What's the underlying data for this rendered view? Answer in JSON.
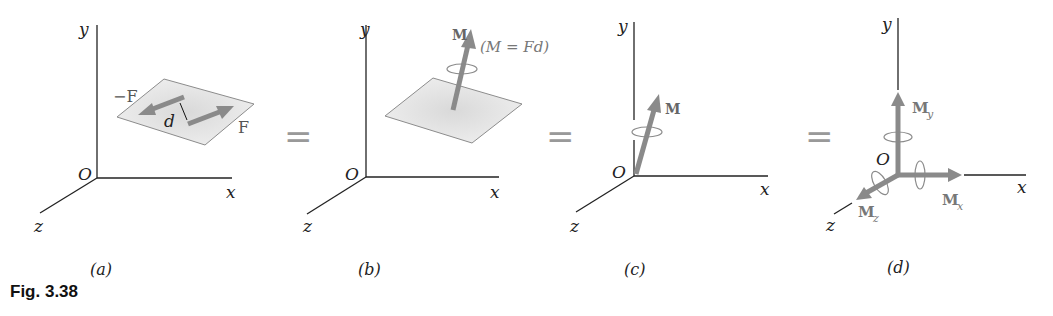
{
  "figure": {
    "caption": "Fig. 3.38",
    "equals": "=",
    "panels": [
      {
        "id": "a",
        "label": "(a)",
        "axes": {
          "x": "x",
          "y": "y",
          "z": "z",
          "origin": "O"
        },
        "forces": {
          "neg": "−F",
          "pos": "F"
        },
        "distance": "d"
      },
      {
        "id": "b",
        "label": "(b)",
        "axes": {
          "x": "x",
          "y": "y",
          "z": "z",
          "origin": "O"
        },
        "moment": "M",
        "formula": "(M = Fd)"
      },
      {
        "id": "c",
        "label": "(c)",
        "axes": {
          "x": "x",
          "y": "y",
          "z": "z",
          "origin": "O"
        },
        "moment": "M"
      },
      {
        "id": "d",
        "label": "(d)",
        "axes": {
          "x": "x",
          "y": "y",
          "z": "z",
          "origin": "O"
        },
        "components": {
          "mx": "M",
          "mx_sub": "x",
          "my": "M",
          "my_sub": "y",
          "mz": "M",
          "mz_sub": "z"
        }
      }
    ]
  },
  "colors": {
    "axis": "#222222",
    "arrow": "#8a8a8a",
    "plane_fill": "#e6e6e6",
    "plane_edge": "#8c8c8c",
    "text_gray": "#777777"
  }
}
